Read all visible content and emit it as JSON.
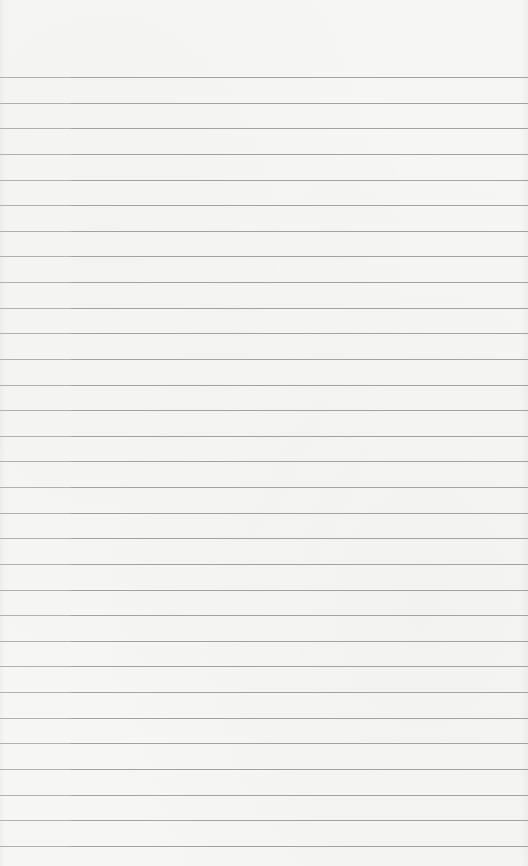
{
  "page": {
    "type": "lined-paper",
    "background_color": "#f6f6f5",
    "rule_color": "#9a9a9a",
    "first_rule_y": 77,
    "rule_spacing": 25.63,
    "rule_count": 31
  }
}
